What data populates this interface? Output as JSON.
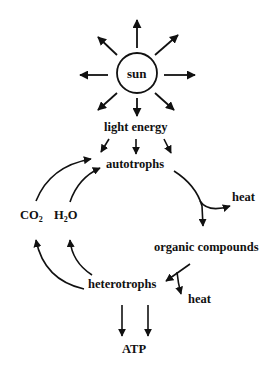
{
  "diagram": {
    "nodes": {
      "sun": "sun",
      "light_energy": "light energy",
      "autotrophs": "autotrophs",
      "heat_1": "heat",
      "organic_compounds": "organic compounds",
      "heterotrophs": "heterotrophs",
      "heat_2": "heat",
      "atp": "ATP",
      "co2_main": "CO",
      "co2_sub": "2",
      "h2o_h": "H",
      "h2o_sub": "2",
      "h2o_o": "O"
    },
    "edges": [
      {
        "from": "sun",
        "to": "light energy",
        "label": "radiates"
      },
      {
        "from": "light energy",
        "to": "autotrophs"
      },
      {
        "from": "autotrophs",
        "to": "organic compounds"
      },
      {
        "from": "autotrophs",
        "to": "heat"
      },
      {
        "from": "organic compounds",
        "to": "heterotrophs"
      },
      {
        "from": "organic compounds",
        "to": "heat"
      },
      {
        "from": "heterotrophs",
        "to": "ATP"
      },
      {
        "from": "heterotrophs",
        "to": "CO2"
      },
      {
        "from": "heterotrophs",
        "to": "H2O"
      },
      {
        "from": "CO2",
        "to": "autotrophs"
      },
      {
        "from": "H2O",
        "to": "autotrophs"
      }
    ],
    "colors": {
      "ink": "#111111",
      "background": "#ffffff"
    }
  }
}
